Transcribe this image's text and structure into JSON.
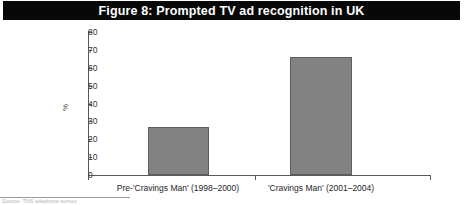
{
  "figure": {
    "title": "Figure 8: Prompted TV ad recognition in UK",
    "title_bar_color": "#080808",
    "title_text_color": "#ffffff",
    "bottom_fragment": "Source: TNS telephone survey"
  },
  "chart_data": {
    "type": "bar",
    "title": "Figure 8: Prompted TV ad recognition in UK",
    "xlabel": "",
    "ylabel": "%",
    "ylim": [
      0,
      80
    ],
    "yticks": [
      0,
      10,
      20,
      30,
      40,
      50,
      60,
      70,
      80
    ],
    "ytick_labels": [
      "0",
      "10",
      "20",
      "30",
      "40",
      "50",
      "60",
      "70",
      "80"
    ],
    "grid": false,
    "legend": "none",
    "categories": [
      "Pre-'Cravings Man' (1998–2000)",
      "'Cravings Man' (2001–2004)"
    ],
    "values": [
      27,
      66
    ],
    "bar_color": "#828282",
    "bar_edge_color": "#5e5e5e",
    "axis_color": "#585858"
  }
}
